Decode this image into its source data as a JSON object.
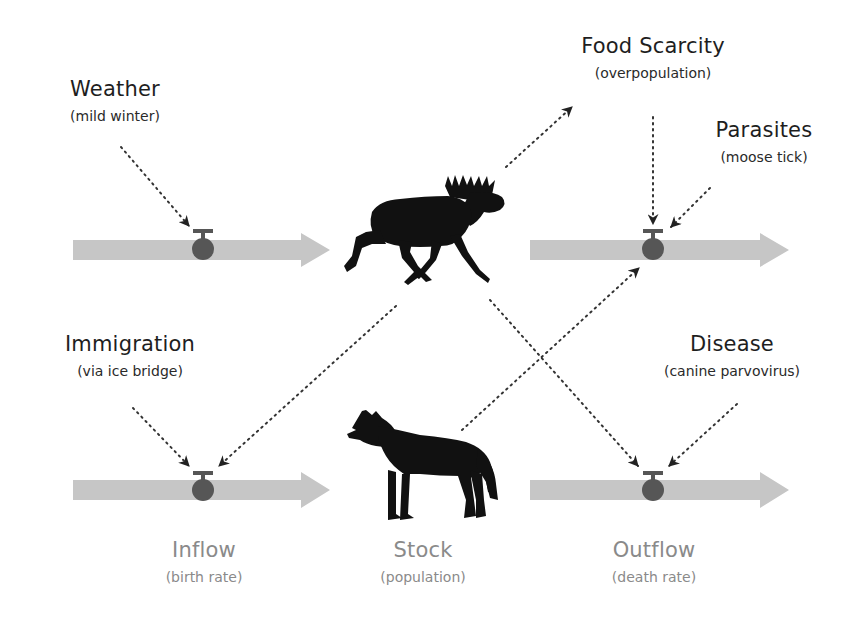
{
  "colors": {
    "flow_arrow": "#c6c6c6",
    "valve": "#565656",
    "link": "#333333",
    "silhouette": "#111111",
    "dark_text": "#1e1e1e",
    "gray_text": "#8a8a8a"
  },
  "factors": {
    "weather": {
      "title": "Weather",
      "subtitle": "(mild winter)"
    },
    "food_scarcity": {
      "title": "Food Scarcity",
      "subtitle": "(overpopulation)"
    },
    "parasites": {
      "title": "Parasites",
      "subtitle": "(moose tick)"
    },
    "immigration": {
      "title": "Immigration",
      "subtitle": "(via ice bridge)"
    },
    "disease": {
      "title": "Disease",
      "subtitle": "(canine parvovirus)"
    }
  },
  "legend": {
    "inflow": {
      "title": "Inflow",
      "subtitle": "(birth rate)"
    },
    "stock": {
      "title": "Stock",
      "subtitle": "(population)"
    },
    "outflow": {
      "title": "Outflow",
      "subtitle": "(death rate)"
    }
  },
  "stocks": {
    "moose": {
      "icon": "moose-icon"
    },
    "wolf": {
      "icon": "wolf-icon"
    }
  }
}
